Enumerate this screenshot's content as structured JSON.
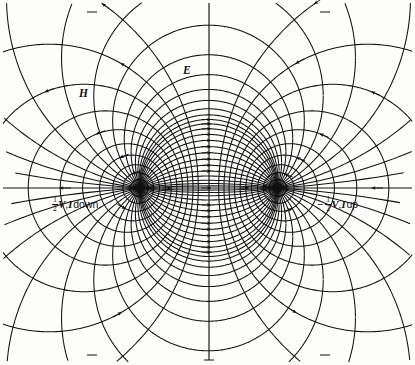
{
  "figure": {
    "background_color": "#fdfdfb",
    "line_color": "#111111"
  },
  "axes": {
    "horizontal": {
      "name": "horizontal-axis",
      "y": 188,
      "x_start": 3,
      "x_end": 412
    },
    "vertical": {
      "name": "vertical-axis",
      "x": 209,
      "y_start": 3,
      "y_end": 360
    }
  },
  "conductors": [
    {
      "id": "left",
      "label_html": "V, I down",
      "cx": 140,
      "cy": 188,
      "sign": "",
      "polarity": "positive",
      "current": "down"
    },
    {
      "id": "right",
      "label_html": "V, I up",
      "cx": 277,
      "cy": 188,
      "sign": "−",
      "polarity": "negative",
      "current": "up"
    }
  ],
  "labels": {
    "left_conductor": {
      "sign": "",
      "fraction_num": "1",
      "fraction_den": "2",
      "v": "V",
      "comma": ",",
      "i": "I",
      "suffix": "down",
      "x": 52,
      "y": 196
    },
    "right_conductor": {
      "sign": "−",
      "fraction_num": "1",
      "fraction_den": "2",
      "v": "V",
      "comma": ",",
      "i": "I",
      "suffix": "up",
      "x": 317,
      "y": 196
    },
    "e_field": {
      "text": "E",
      "x": 183,
      "y": 65
    },
    "h_field": {
      "text": "H",
      "x": 79,
      "y": 88
    }
  },
  "chart_data": {
    "type": "line",
    "xlabel": "",
    "ylabel": "",
    "grid": false,
    "legend": [
      "E",
      "H"
    ],
    "legend_position": "in-plot",
    "poles": {
      "left": [
        140,
        188
      ],
      "right": [
        277,
        188
      ],
      "half_separation": 68.5,
      "center": [
        208.5,
        188
      ]
    },
    "series": [
      {
        "name": "E",
        "description": "Electric field lines: coaxial circular arcs passing through both conductor centers",
        "direction": "from left (+) conductor to right (−) conductor",
        "count": 14
      },
      {
        "name": "H",
        "description": "Magnetic field lines: orthogonal Apollonius circles encircling each conductor",
        "direction": "counterclockwise around each conductor",
        "count": 16
      }
    ]
  }
}
